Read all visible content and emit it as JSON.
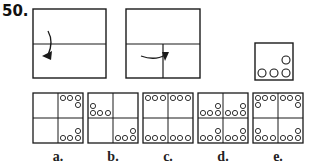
{
  "question": {
    "number": "50.",
    "fold_steps": [
      {
        "id": "step-1",
        "description": "Square folded top half down along horizontal center line",
        "arrow": "curved-down"
      },
      {
        "id": "step-2",
        "description": "Folded rectangle folded left half to right along vertical center line",
        "arrow": "curved-right"
      },
      {
        "id": "punched",
        "description": "Folded square with holes punched",
        "holes": [
          [
            1,
            0
          ],
          [
            0,
            1
          ],
          [
            1,
            1
          ],
          [
            2,
            1
          ]
        ]
      }
    ],
    "options": [
      {
        "label": "a.",
        "holes_per_quadrant": "right quadrants only: 3 along outer edge + 1 in corner column"
      },
      {
        "label": "b.",
        "holes_per_quadrant": "top-left and bottom-right quadrants"
      },
      {
        "label": "c.",
        "holes_per_quadrant": "3 holes along top and bottom edges in each quadrant"
      },
      {
        "label": "d.",
        "holes_per_quadrant": "4 holes (3 row + 1) near center lines and bottom edges"
      },
      {
        "label": "e.",
        "holes_per_quadrant": "4 holes mirrored into each corner"
      }
    ]
  },
  "colors": {
    "line": "#1a1a1a",
    "background": "#ffffff"
  }
}
